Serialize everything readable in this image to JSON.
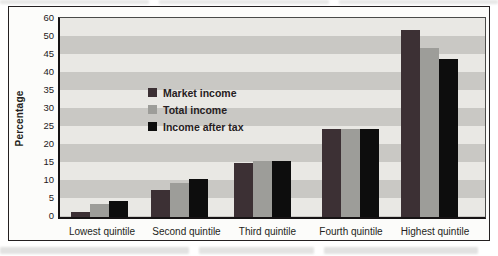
{
  "chart_data": {
    "type": "bar",
    "title": "",
    "ylabel": "Percentage",
    "xlabel": "",
    "categories": [
      "Lowest quintile",
      "Second quintile",
      "Third quintile",
      "Fourth quintile",
      "Highest quintile"
    ],
    "series": [
      {
        "name": "Market income",
        "color": "#3c3034",
        "values": [
          1.5,
          7.5,
          15.0,
          24.5,
          52.0
        ]
      },
      {
        "name": "Total income",
        "color": "#9d9d99",
        "values": [
          3.5,
          9.5,
          15.5,
          24.5,
          47.0
        ]
      },
      {
        "name": "Income after tax",
        "color": "#0d0d0d",
        "values": [
          4.5,
          10.5,
          15.5,
          24.5,
          44.0
        ]
      }
    ],
    "y_ticks": [
      60,
      50,
      45,
      40,
      35,
      30,
      25,
      20,
      15,
      10,
      5,
      0
    ],
    "ylim": [
      0,
      55
    ],
    "grid": "horizontal alternating gray bands, 5-unit stripes",
    "legend_position": "upper-left inside plot area"
  },
  "colors": {
    "stripe_light": "#e9e8e4",
    "stripe_dark": "#c9c8c4",
    "axis": "#161314",
    "frame_border": "#242021",
    "text": "#241f21"
  }
}
